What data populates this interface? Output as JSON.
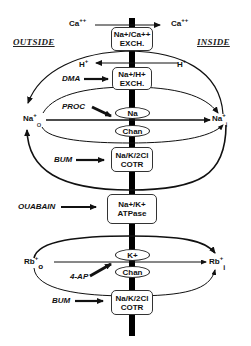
{
  "regions": {
    "outside": "OUTSIDE",
    "inside": "INSIDE"
  },
  "ions": {
    "ca_out": "Ca",
    "ca_out_charge": "++",
    "ca_in": "Ca",
    "ca_in_charge": "++",
    "h_top_left": "H",
    "h_top_left_charge": "+",
    "h_top_right": "H",
    "h_top_right_charge": "+",
    "na_o": "Na",
    "na_o_charge": "+",
    "na_o_sub": "o",
    "na_i": "Na",
    "na_i_charge": "+",
    "na_i_sub": "i",
    "rb_o": "Rb",
    "rb_o_charge": "+",
    "rb_o_sub": "o",
    "rb_i": "Rb",
    "rb_i_charge": "+",
    "rb_i_sub": "i"
  },
  "transporters": [
    {
      "id": "na-ca-exchanger",
      "line1": "Na+/Ca++",
      "line2": "EXCH."
    },
    {
      "id": "na-h-exchanger",
      "line1": "Na+/H+",
      "line2": "EXCH."
    },
    {
      "id": "na-k-2cl-cotransporter-1",
      "line1": "Na/K/2Cl",
      "line2": "COTR"
    },
    {
      "id": "na-k-atpase",
      "line1": "Na+/K+",
      "line2": "ATPase"
    },
    {
      "id": "na-k-2cl-cotransporter-2",
      "line1": "Na/K/2Cl",
      "line2": "COTR"
    }
  ],
  "channels": [
    {
      "id": "na-channel",
      "top": "Na",
      "bottom": "Chan"
    },
    {
      "id": "k-channel",
      "top": "K+",
      "bottom": "Chan"
    }
  ],
  "inhibitors": {
    "dma": "DMA",
    "proc": "PROC",
    "bum1": "BUM",
    "ouabain": "OUABAIN",
    "ap4": "4-AP",
    "bum2": "BUM"
  },
  "colors": {
    "line": "#111111",
    "membrane": "#000000",
    "background": "#ffffff"
  }
}
